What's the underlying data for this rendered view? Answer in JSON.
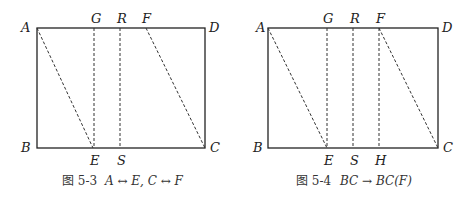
{
  "figures": [
    {
      "id": "fig-5-3",
      "caption_prefix": "图 5-3",
      "caption_math": "A ↔ E, C ↔ F",
      "points": {
        "A": "A",
        "B": "B",
        "C": "C",
        "D": "D",
        "G": "G",
        "R": "R",
        "F": "F",
        "E": "E",
        "S": "S"
      },
      "solid": [
        "AD",
        "DC",
        "CB",
        "BA"
      ],
      "dashed": [
        "AE",
        "GE",
        "RS",
        "FC"
      ]
    },
    {
      "id": "fig-5-4",
      "caption_prefix": "图 5-4",
      "caption_math": "BC → BC(F)",
      "points": {
        "A": "A",
        "B": "B",
        "C": "C",
        "D": "D",
        "G": "G",
        "R": "R",
        "F": "F",
        "E": "E",
        "S": "S",
        "H": "H"
      },
      "solid": [
        "AD",
        "DC",
        "CB",
        "BA"
      ],
      "dashed": [
        "AE",
        "GE",
        "RS",
        "FH",
        "FC"
      ]
    }
  ],
  "colors": {
    "line": "#222222",
    "text": "#222222"
  }
}
